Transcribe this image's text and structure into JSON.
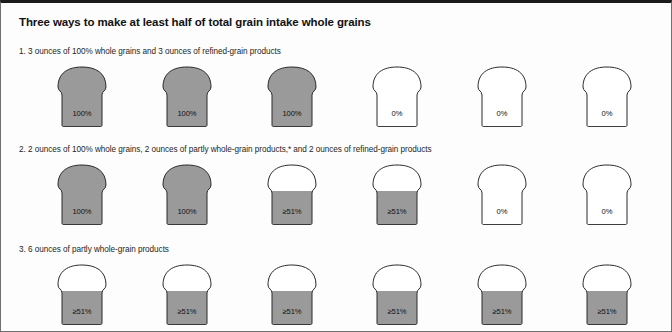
{
  "figure": {
    "title": "Three ways to make at least half of total grain intake whole grains",
    "colors": {
      "fill_gray": "#9a9a9a",
      "outline": "#2a2a2a",
      "empty": "#ffffff",
      "text": "#1d1d1d",
      "frame_top": "#1b1b1b"
    }
  },
  "rows": [
    {
      "caption": "1. 3 ounces of 100% whole grains and 3 ounces of refined-grain products",
      "slices": [
        {
          "label": "100%",
          "fill": "full"
        },
        {
          "label": "100%",
          "fill": "full"
        },
        {
          "label": "100%",
          "fill": "full"
        },
        {
          "label": "0%",
          "fill": "none"
        },
        {
          "label": "0%",
          "fill": "none"
        },
        {
          "label": "0%",
          "fill": "none"
        }
      ]
    },
    {
      "caption": "2. 2 ounces of 100% whole grains, 2 ounces of partly whole-grain products,* and 2 ounces of refined-grain products",
      "slices": [
        {
          "label": "100%",
          "fill": "full"
        },
        {
          "label": "100%",
          "fill": "full"
        },
        {
          "label": "≥51%",
          "fill": "partial"
        },
        {
          "label": "≥51%",
          "fill": "partial"
        },
        {
          "label": "0%",
          "fill": "none"
        },
        {
          "label": "0%",
          "fill": "none"
        }
      ]
    },
    {
      "caption": "3. 6 ounces of partly whole-grain products",
      "slices": [
        {
          "label": "≥51%",
          "fill": "partial"
        },
        {
          "label": "≥51%",
          "fill": "partial"
        },
        {
          "label": "≥51%",
          "fill": "partial"
        },
        {
          "label": "≥51%",
          "fill": "partial"
        },
        {
          "label": "≥51%",
          "fill": "partial"
        },
        {
          "label": "≥51%",
          "fill": "partial"
        }
      ]
    }
  ]
}
